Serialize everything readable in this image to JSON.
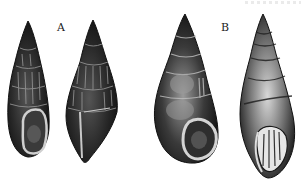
{
  "figure": {
    "labels": {
      "a": "A",
      "b": "B"
    },
    "specimens": [
      {
        "group": "A",
        "view": "apertural",
        "description": "dark ribbed turreted shell with oval aperture"
      },
      {
        "group": "A",
        "view": "lateral",
        "description": "dark ribbed turreted shell, side view"
      },
      {
        "group": "B",
        "view": "apertural",
        "description": "smooth dark turreted shell with round aperture"
      },
      {
        "group": "B",
        "view": "apertural-oblique",
        "description": "lighter turreted shell with plicate aperture"
      }
    ],
    "colors": {
      "ink": "#1a1a1a",
      "paper": "#ffffff",
      "highlight": "#bdbdbd"
    }
  }
}
